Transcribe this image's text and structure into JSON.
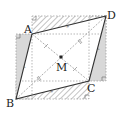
{
  "diagram": {
    "type": "geometry-parallelogram",
    "points": {
      "A": {
        "label": "A",
        "x": 32,
        "y": 34
      },
      "B": {
        "label": "B",
        "x": 16,
        "y": 99
      },
      "C": {
        "label": "C",
        "x": 89,
        "y": 81
      },
      "D": {
        "label": "D",
        "x": 106,
        "y": 16
      },
      "M": {
        "label": "M",
        "x": 61,
        "y": 57
      }
    },
    "colors": {
      "line": "#333333",
      "dashed": "#999999",
      "gray_fill": "#d8d8d8",
      "hatch": "#888888"
    }
  }
}
